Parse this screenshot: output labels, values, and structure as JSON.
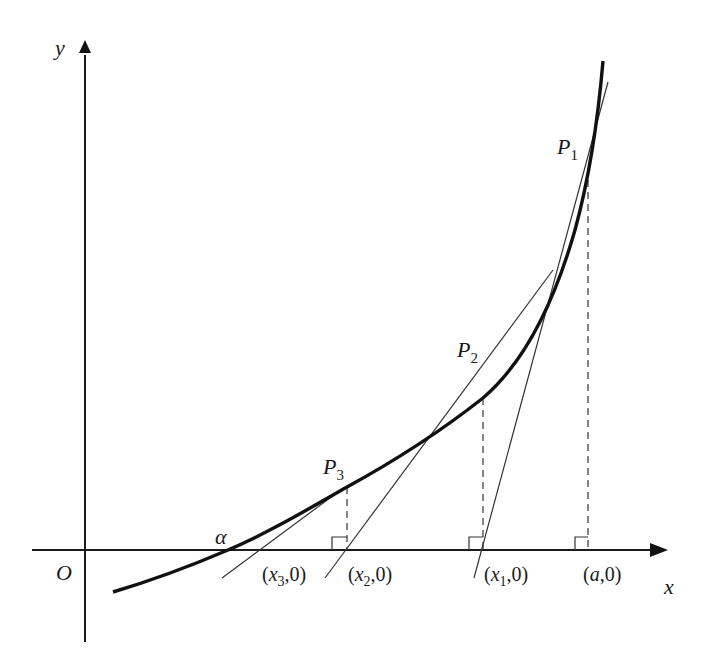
{
  "diagram": {
    "axes": {
      "x_label": "x",
      "y_label": "y",
      "origin_label": "O"
    },
    "root_label": "α",
    "points": [
      {
        "name": "P",
        "sub": "1"
      },
      {
        "name": "P",
        "sub": "2"
      },
      {
        "name": "P",
        "sub": "3"
      }
    ],
    "axis_intercepts": [
      {
        "open": "(",
        "var": "a",
        "sub": "",
        "rest": ",0)"
      },
      {
        "open": "(",
        "var": "x",
        "sub": "1",
        "rest": ",0)"
      },
      {
        "open": "(",
        "var": "x",
        "sub": "2",
        "rest": ",0)"
      },
      {
        "open": "(",
        "var": "x",
        "sub": "3",
        "rest": ",0)"
      }
    ],
    "colors": {
      "curve": "#111111",
      "tangent": "#333333",
      "dashed": "#444444",
      "background": "#ffffff"
    }
  }
}
